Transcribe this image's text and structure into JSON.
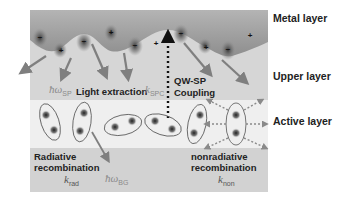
{
  "layers": {
    "metal": "Metal layer",
    "upper": "Upper layer",
    "active": "Active layer"
  },
  "labels": {
    "light_extraction": "Light extraction",
    "qw_sp_line1": "QW-SP",
    "qw_sp_line2": "Coupling",
    "radiative_line1": "Radiative",
    "radiative_line2": "recombination",
    "nonradiative_line1": "nonradiative",
    "nonradiative_line2": "recombination"
  },
  "symbols": {
    "hw_sp": {
      "base": "ħω",
      "sub": "SP"
    },
    "k_spc": {
      "base": "k",
      "sub": "SPC"
    },
    "k_rad": {
      "base": "k",
      "sub": "rad"
    },
    "hw_bg": {
      "base": "ħω",
      "sub": "BG"
    },
    "k_non": {
      "base": "k",
      "sub": "non"
    }
  },
  "charges": [
    "−",
    "+",
    "−",
    "+",
    "−",
    "+",
    "−",
    "+",
    "−",
    "+"
  ],
  "colors": {
    "metal": "#9a9a9a",
    "upper": "#d6d6d6",
    "active": "#efefef",
    "bottom": "#d2d2d2",
    "arrow": "#7f7f7f",
    "text": "#222222"
  }
}
